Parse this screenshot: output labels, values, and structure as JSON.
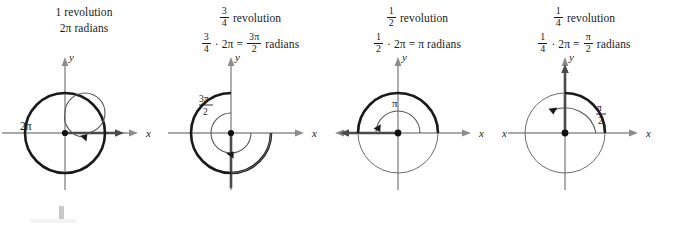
{
  "figure": {
    "axis_labels": {
      "x": "x",
      "y": "y"
    },
    "colors": {
      "ink": "#1a1a1a",
      "axis_gray": "#8c8c8c",
      "thin_curve": "#555555",
      "background": "#ffffff"
    }
  },
  "panels": [
    {
      "id": "one-revolution",
      "caption_line_1": {
        "fraction": null,
        "text": "1 revolution"
      },
      "caption_line_2": {
        "text": "2π radians"
      },
      "angle_label": "2π",
      "revolution": "1",
      "degrees": 360,
      "terminal_ray": "positive-x",
      "x_label": "x",
      "y_label": "y"
    },
    {
      "id": "three-quarter-revolution",
      "caption_line_1": {
        "fraction": {
          "num": "3",
          "den": "4"
        },
        "text": "revolution"
      },
      "caption_line_2": {
        "text": "· 2π =   radians"
      },
      "angle_label": {
        "num": "3π",
        "den": "2"
      },
      "revolution": "3/4",
      "degrees": 270,
      "terminal_ray": "negative-y",
      "x_label": "x",
      "y_label": "y"
    },
    {
      "id": "half-revolution",
      "caption_line_1": {
        "fraction": {
          "num": "1",
          "den": "2"
        },
        "text": "revolution"
      },
      "caption_line_2": {
        "text": "· 2π = π radians"
      },
      "angle_label": "π",
      "revolution": "1/2",
      "degrees": 180,
      "terminal_ray": "negative-x",
      "x_label": "x",
      "y_label": "y"
    },
    {
      "id": "quarter-revolution",
      "caption_line_1": {
        "fraction": {
          "num": "1",
          "den": "4"
        },
        "text": "revolution"
      },
      "caption_line_2": {
        "text": "· 2π =   radians"
      },
      "angle_label": {
        "num": "π",
        "den": "2"
      },
      "revolution": "1/4",
      "degrees": 90,
      "terminal_ray": "positive-y",
      "x_label": "x",
      "y_label": "y"
    }
  ]
}
